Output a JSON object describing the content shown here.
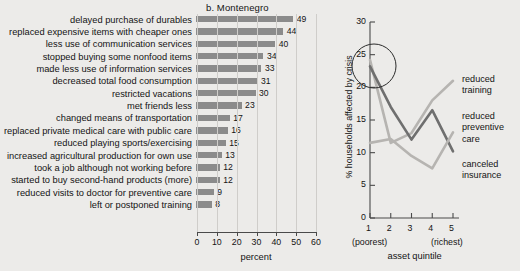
{
  "panel": {
    "title": "b.  Montenegro"
  },
  "chart_data": [
    {
      "type": "bar",
      "orientation": "horizontal",
      "title": "b.  Montenegro",
      "xlabel": "percent",
      "ylabel": "",
      "xlim": [
        0,
        60
      ],
      "xticks": [
        0,
        10,
        20,
        30,
        40,
        50,
        60
      ],
      "grid": false,
      "legend": "none",
      "bar_color": "#8b8b8b",
      "categories": [
        "delayed purchase of durables",
        "replaced expensive items with cheaper ones",
        "less use of communication services",
        "stopped buying some nonfood items",
        "made less use of information services",
        "decreased total food consumption",
        "restricted vacations",
        "met friends less",
        "changed means of transportation",
        "replaced private medical care with public care",
        "reduced playing sports/exercising",
        "increased agricultural production for own use",
        "took a job although not working before",
        "started to buy second-hand products (more)",
        "reduced visits to doctor for preventive care",
        "left or postponed training"
      ],
      "values": [
        49,
        44,
        40,
        34,
        33,
        31,
        30,
        23,
        17,
        16,
        15,
        13,
        12,
        12,
        9,
        8
      ]
    },
    {
      "type": "line",
      "title": "",
      "xlabel": "asset quintile",
      "ylabel": "% households affected by crisis",
      "x": [
        1,
        2,
        3,
        4,
        5
      ],
      "xticklabels": [
        "1",
        "2",
        "3",
        "4",
        "5"
      ],
      "x_extreme_low": "(poorest)",
      "x_extreme_high": "(richest)",
      "ylim": [
        0,
        30
      ],
      "yticks": [
        0,
        5,
        10,
        15,
        20,
        25,
        30
      ],
      "grid": false,
      "legend": "right",
      "annotation": {
        "shape": "circle",
        "note": ""
      },
      "series": [
        {
          "name": "reduced training",
          "color": "#b6b4b1",
          "values": [
            24.2,
            11.5,
            13.0,
            18.0,
            21.0
          ]
        },
        {
          "name": "reduced preventive care",
          "color": "#6f6f6f",
          "values": [
            23.2,
            17.0,
            12.0,
            16.5,
            10.2
          ]
        },
        {
          "name": "canceled insurance",
          "color": "#b6b4b1",
          "values": [
            11.5,
            12.1,
            9.5,
            7.6,
            13.1
          ]
        }
      ]
    }
  ],
  "bar_axis": {
    "ticklabels": [
      "0",
      "10",
      "20",
      "30",
      "40",
      "50",
      "60"
    ],
    "xlabel": "percent"
  },
  "line_axis": {
    "yticklabels": [
      "0",
      "5",
      "10",
      "15",
      "20",
      "25",
      "30"
    ],
    "xticklabels": [
      "1",
      "2",
      "3",
      "4",
      "5"
    ],
    "xlabel": "asset quintile",
    "ylabel": "% households affected by crisis",
    "poorest_label": "(poorest)",
    "richest_label": "(richest)"
  },
  "line_legend": {
    "items": [
      "reduced\ntraining",
      "reduced\npreventive\ncare",
      "canceled\ninsurance"
    ],
    "l1a": "reduced",
    "l1b": "training",
    "l2a": "reduced",
    "l2b": "preventive",
    "l2c": "care",
    "l3a": "canceled",
    "l3b": "insurance"
  }
}
